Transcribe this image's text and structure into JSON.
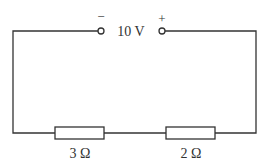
{
  "diagram": {
    "type": "series circuit",
    "source": {
      "voltage_label": "10 V",
      "negative_terminal_symbol": "−",
      "positive_terminal_symbol": "+"
    },
    "resistors": [
      {
        "label": "3 Ω"
      },
      {
        "label": "2 Ω"
      }
    ],
    "colors": {
      "wire": "#333333",
      "background": "#ffffff"
    }
  }
}
